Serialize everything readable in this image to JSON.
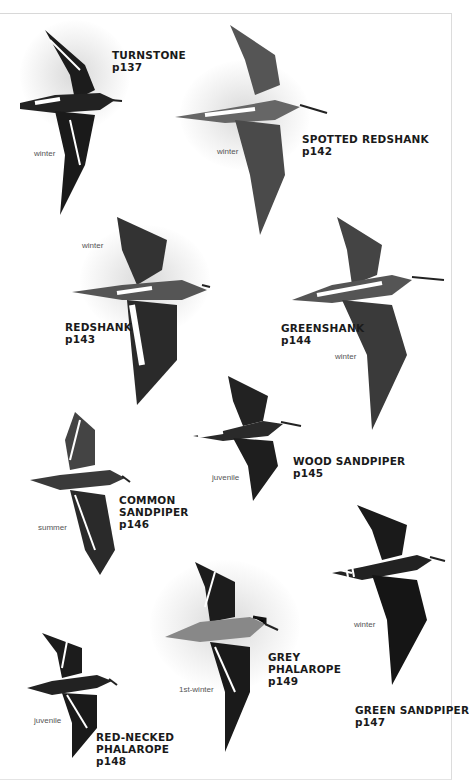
{
  "page": {
    "type": "field-guide-plate"
  },
  "birds": [
    {
      "name": "TURNSTONE",
      "page": "p137",
      "plumage": "winter"
    },
    {
      "name": "SPOTTED REDSHANK",
      "page": "p142",
      "plumage": "winter"
    },
    {
      "name": "REDSHANK",
      "page": "p143",
      "plumage": "winter"
    },
    {
      "name": "GREENSHANK",
      "page": "p144",
      "plumage": "winter"
    },
    {
      "name": "WOOD SANDPIPER",
      "page": "p145",
      "plumage": "juvenile"
    },
    {
      "name": "COMMON",
      "name2": "SANDPIPER",
      "page": "p146",
      "plumage": "summer"
    },
    {
      "name": "GREEN SANDPIPER",
      "page": "p147",
      "plumage": "winter"
    },
    {
      "name": "RED-NECKED",
      "name2": "PHALAROPE",
      "page": "p148",
      "plumage": "juvenile"
    },
    {
      "name": "GREY",
      "name2": "PHALAROPE",
      "page": "p149",
      "plumage": "1st-winter"
    }
  ]
}
